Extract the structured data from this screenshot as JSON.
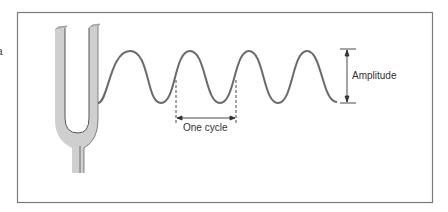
{
  "diagram": {
    "labels": {
      "amplitude": "Amplitude",
      "one_cycle": "One cycle",
      "edge_fragment": "a"
    },
    "colors": {
      "frame": "#777777",
      "wave": "#6a6a6a",
      "fork_fill": "#cfcfcf",
      "fork_outline": "#555555",
      "annotation": "#333333"
    },
    "wave": {
      "cycles_shown": 4,
      "peaks_x": [
        130,
        190,
        249,
        307
      ],
      "peak_y": 51,
      "trough_y": 103
    }
  }
}
